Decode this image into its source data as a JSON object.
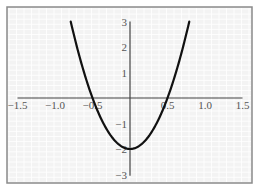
{
  "chart_data": {
    "type": "line",
    "title": "",
    "xlabel": "",
    "ylabel": "",
    "xlim": [
      -1.5,
      1.5
    ],
    "ylim": [
      -3,
      3
    ],
    "grid": true,
    "legend": null,
    "x_ticks": [
      "-1.5",
      "-1.0",
      "-0.5",
      "0.5",
      "1.0",
      "1.5"
    ],
    "y_ticks": [
      "3",
      "2",
      "1",
      "-1",
      "-2",
      "-3"
    ],
    "series": [
      {
        "name": "y = 8x^2 - 2",
        "x": [
          -0.79,
          -0.7,
          -0.6,
          -0.5,
          -0.4,
          -0.3,
          -0.2,
          -0.1,
          0,
          0.1,
          0.2,
          0.3,
          0.4,
          0.5,
          0.6,
          0.7,
          0.79
        ],
        "values": [
          3.0,
          1.92,
          0.88,
          0.0,
          -0.72,
          -1.28,
          -1.68,
          -1.92,
          -2.0,
          -1.92,
          -1.68,
          -1.28,
          -0.72,
          0.0,
          0.88,
          1.92,
          3.0
        ]
      }
    ],
    "annotations": {
      "x_intercepts": [
        -0.5,
        0.5
      ],
      "y_intercept": -2,
      "vertex": [
        0,
        -2
      ]
    }
  },
  "colors": {
    "background": "#f3f3f3",
    "grid": "#ffffff",
    "frame": "#8a8a8a",
    "axis": "#444444",
    "curve": "#111111",
    "label": "#555555"
  }
}
